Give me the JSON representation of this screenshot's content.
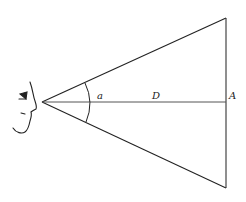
{
  "diagram": {
    "type": "viewing-angle",
    "labels": {
      "angle": "a",
      "distance": "D",
      "object": "A"
    },
    "geometry": {
      "eye_apex": [
        42,
        102
      ],
      "top_vertex": [
        226,
        18
      ],
      "bottom_vertex": [
        226,
        188
      ],
      "baseline_y": 102
    },
    "colors": {
      "stroke": "#222222",
      "baseline": "#555555",
      "background": "#ffffff"
    }
  }
}
